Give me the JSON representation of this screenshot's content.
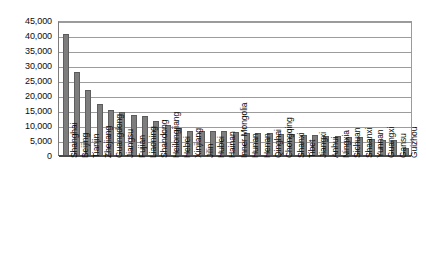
{
  "chart_data": {
    "type": "bar",
    "title": "",
    "subtitle": "",
    "xlabel": "",
    "ylabel": "",
    "ylim": [
      0,
      45000
    ],
    "ytick_interval": 5000,
    "ytick_labels": [
      "45,000",
      "40,000",
      "35,000",
      "30,000",
      "25,000",
      "20,000",
      "15,000",
      "10,000",
      "5,000",
      "0"
    ],
    "ytick_values": [
      45000,
      40000,
      35000,
      30000,
      25000,
      20000,
      15000,
      10000,
      5000,
      0
    ],
    "grid": true,
    "legend": "none",
    "bar_color": "#7d7d7d",
    "categories": [
      "Shanghai",
      "Beijing",
      "Tianjin",
      "Zhejiang",
      "Guangdong",
      "Jiangsu",
      "Fujian",
      "Liaoning",
      "Shandong",
      "Heilongjiang",
      "Hebei",
      "Xinjiang",
      "Jilin",
      "Hubei",
      "Hainan",
      "Inner Mongolia",
      "Hunan",
      "Henan",
      "Qinghai",
      "Chongqing",
      "Shanxi",
      "Tibet",
      "Jiangxi",
      "Anhui",
      "Ningxia",
      "Sichuan",
      "Shaanxi",
      "Yunnan",
      "Guangxi",
      "Gansu",
      "Guizhou"
    ],
    "values": [
      40500,
      28000,
      22000,
      17000,
      15200,
      14500,
      13300,
      13000,
      11500,
      10200,
      9000,
      8200,
      8200,
      8100,
      7900,
      7700,
      7500,
      7400,
      7300,
      7100,
      6900,
      6800,
      6600,
      6500,
      6300,
      6200,
      6100,
      5400,
      5200,
      5000,
      2500
    ]
  }
}
